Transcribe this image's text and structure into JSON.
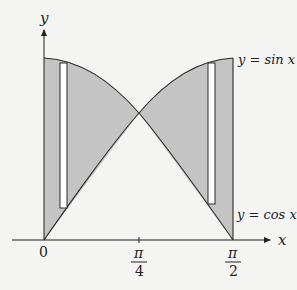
{
  "figure": {
    "axes": {
      "y_label": "y",
      "x_label": "x"
    },
    "ticks": {
      "origin": "0",
      "pi_over_4": {
        "num": "π",
        "den": "4"
      },
      "pi_over_2": {
        "num": "π",
        "den": "2"
      }
    },
    "curves": {
      "sin_label": "y = sin x",
      "cos_label": "y = cos x"
    },
    "colors": {
      "shade": "#c4c4c4",
      "stroke": "#2a2a2a",
      "background": "#f4f4f2",
      "strip": "#ffffff"
    }
  }
}
